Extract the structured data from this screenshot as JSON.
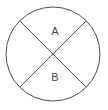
{
  "diagram": {
    "type": "geometric-figure",
    "background_color": "#ffffff",
    "stroke_color": "#4f4f4f",
    "label_color": "#4a4a4a",
    "stroke_width": 1,
    "circle": {
      "center_x": 53,
      "center_y": 54,
      "radius": 47
    },
    "chords": [
      {
        "name": "chord-top-left-to-bottom-right",
        "x1": 20,
        "y1": 21,
        "x2": 86,
        "y2": 87
      },
      {
        "name": "chord-top-right-to-bottom-left",
        "x1": 86,
        "y1": 21,
        "x2": 20,
        "y2": 87
      }
    ],
    "labels": [
      {
        "name": "region-label-a",
        "text": "A",
        "x": 55,
        "y": 32
      },
      {
        "name": "region-label-b",
        "text": "B",
        "x": 55,
        "y": 78
      }
    ]
  }
}
